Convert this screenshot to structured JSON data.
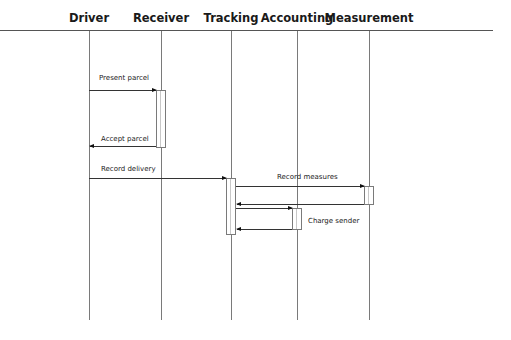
{
  "diagram": {
    "type": "sequence",
    "actors": [
      {
        "name": "Driver",
        "x": 89
      },
      {
        "name": "Receiver",
        "x": 161
      },
      {
        "name": "Tracking",
        "x": 231
      },
      {
        "name": "Accounting",
        "x": 297
      },
      {
        "name": "Measurement",
        "x": 369
      }
    ],
    "messages": [
      {
        "label": "Present parcel",
        "from": "Driver",
        "to": "Receiver"
      },
      {
        "label": "Accept parcel",
        "from": "Receiver",
        "to": "Driver"
      },
      {
        "label": "Record delivery",
        "from": "Driver",
        "to": "Tracking"
      },
      {
        "label": "Record measures",
        "from": "Tracking",
        "to": "Measurement"
      },
      {
        "label": "",
        "from": "Measurement",
        "to": "Tracking"
      },
      {
        "label": "",
        "from": "Tracking",
        "to": "Accounting"
      },
      {
        "label": "Charge sender",
        "from": "Accounting",
        "to": "Tracking"
      }
    ]
  }
}
